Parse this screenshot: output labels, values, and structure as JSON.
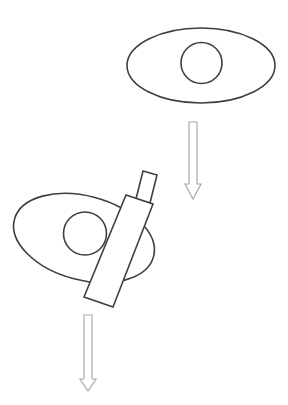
{
  "canvas": {
    "width": 288,
    "height": 405,
    "background": "#ffffff"
  },
  "colors": {
    "shape_stroke": "#3f3f3f",
    "arrow_stroke": "#a8a8a8",
    "fill": "#ffffff"
  },
  "diagram": {
    "labels": [],
    "top_figure": {
      "description": "Ellipse with centered circle (untilted)",
      "ellipse": {
        "cx": 201,
        "cy": 65.5,
        "rx": 74,
        "ry": 37.5,
        "rotation_deg": 0
      },
      "circle": {
        "cx": 201.5,
        "cy": 63,
        "r": 20.5
      }
    },
    "top_arrow": {
      "direction": "down",
      "points": "189,122 197,122 197,184 201,184 193,199 185,184 189,184"
    },
    "bottom_figure": {
      "description": "Tilted ellipse with circle, occluded by rotated rectangle with small rectangle extension",
      "ellipse": {
        "cx": 84,
        "cy": 238,
        "rx": 72,
        "ry": 42,
        "rotation_deg": 15
      },
      "circle": {
        "cx": 85,
        "cy": 233.5,
        "r": 21.5
      },
      "large_rect": {
        "points": "126,195 153,204 113,307 84,297"
      },
      "small_rect": {
        "points": "143,171 157,175 150,203 136,199"
      }
    },
    "bottom_arrow": {
      "direction": "down",
      "points": "84,315 92,315 92,379 96,379 88,391 80,379 84,379"
    }
  }
}
